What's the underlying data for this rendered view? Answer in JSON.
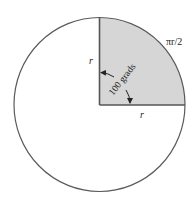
{
  "diagram": {
    "colors": {
      "background": "#ffffff",
      "circle_stroke": "#5a5a5a",
      "quadrant_fill": "#d6d6d6",
      "radius_stroke": "#555555",
      "text": "#222222"
    },
    "labels": {
      "radius_vertical": "r",
      "radius_horizontal": "r",
      "arc_length": "πr/2",
      "angle": "100 grads"
    },
    "geometry": {
      "center": [
        99.5,
        105
      ],
      "radius": 86
    }
  }
}
